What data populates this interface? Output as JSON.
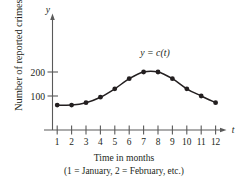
{
  "figure": {
    "y_axis_title": "Number of reported crimes",
    "caption_line1": "Time in months",
    "caption_line2": "(1 = January, 2 = February, etc.)",
    "curve_label": "y = c(t)",
    "y_axis_letter": "y",
    "x_axis_letter": "t",
    "ink_color": "#231f20",
    "axis_color": "#5a5a5a"
  },
  "chart_data": {
    "type": "line",
    "title": "",
    "subtitle": "",
    "xlabel": "Time in months",
    "xlabel_note": "(1 = January, 2 = February, etc.)",
    "ylabel": "Number of reported crimes",
    "x_axis_symbol": "t",
    "y_axis_symbol": "y",
    "series_label": "y = c(t)",
    "grid": false,
    "legend": "none",
    "markers": true,
    "x": [
      1,
      2,
      3,
      4,
      5,
      6,
      7,
      8,
      9,
      10,
      11,
      12
    ],
    "xticklabels": [
      "1",
      "2",
      "3",
      "4",
      "5",
      "6",
      "7",
      "8",
      "9",
      "10",
      "11",
      "12"
    ],
    "values": [
      62,
      62,
      72,
      95,
      130,
      172,
      200,
      200,
      172,
      130,
      100,
      72
    ],
    "yticks": [
      100,
      200
    ],
    "yticklabels": [
      "100",
      "200"
    ],
    "xlim": [
      0.6,
      12.6
    ],
    "ylim": [
      0,
      245
    ],
    "y_axis_broken": true
  }
}
